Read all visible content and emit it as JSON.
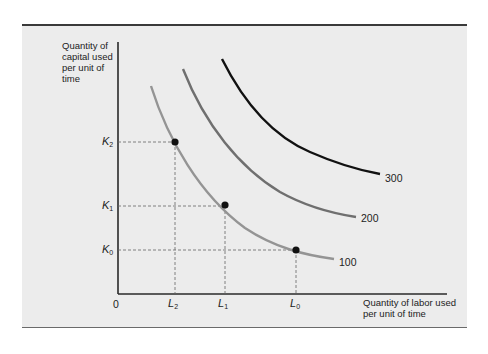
{
  "diagram": {
    "type": "isoquant map",
    "y_axis_label": "Quantity of capital used per unit of time",
    "x_axis_label": "Quantity of labor used per unit of time",
    "y_axis_label_lines": [
      "Quantity of",
      "capital used",
      "per unit of",
      "time"
    ],
    "x_axis_label_lines": [
      "Quantity of labor used",
      "per unit of time"
    ],
    "origin_label": "0",
    "y_ticks": [
      {
        "base": "K",
        "sub": "2"
      },
      {
        "base": "K",
        "sub": "1"
      },
      {
        "base": "K",
        "sub": "0"
      }
    ],
    "x_ticks": [
      {
        "base": "L",
        "sub": "2"
      },
      {
        "base": "L",
        "sub": "1"
      },
      {
        "base": "L",
        "sub": "0"
      }
    ],
    "curves": [
      {
        "label": "100",
        "color": "#8e8e8e"
      },
      {
        "label": "200",
        "color": "#6e6e6e"
      },
      {
        "label": "300",
        "color": "#111111"
      }
    ],
    "points": [
      {
        "on_curve": "100",
        "x": "L2",
        "y": "K2"
      },
      {
        "on_curve": "100",
        "x": "L1",
        "y": "K1"
      },
      {
        "on_curve": "100",
        "x": "L0",
        "y": "K0"
      }
    ]
  }
}
